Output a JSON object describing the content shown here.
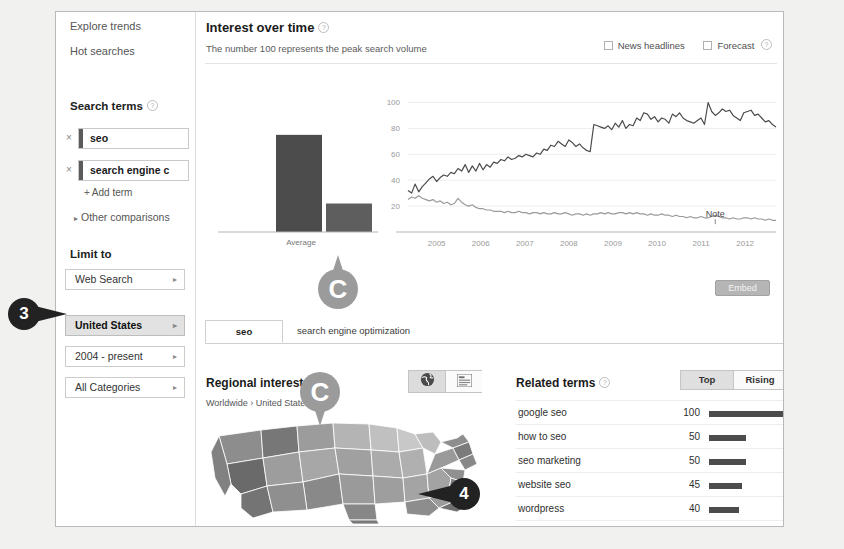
{
  "sidebar": {
    "nav": [
      {
        "label": "Explore trends"
      },
      {
        "label": "Hot searches"
      }
    ],
    "search_terms_title": "Search terms",
    "terms": [
      {
        "value": "seo",
        "color": "#5b5b5b",
        "remove_label": "×"
      },
      {
        "value": "search engine c",
        "color": "#5b5b5b",
        "remove_label": "×"
      }
    ],
    "add_term_label": "Add term",
    "add_term_plus": "+",
    "other_comparisons_label": "Other comparisons",
    "limit_to_title": "Limit to",
    "limits": [
      {
        "label": "Web Search",
        "selected": false
      },
      {
        "label": "United States",
        "selected": true
      },
      {
        "label": "2004 - present",
        "selected": false
      },
      {
        "label": "All Categories",
        "selected": false
      }
    ]
  },
  "interest_over_time": {
    "title": "Interest over time",
    "subtitle": "The number 100 represents the peak search volume",
    "options": [
      {
        "label": "News headlines",
        "checked": false
      },
      {
        "label": "Forecast",
        "checked": false
      }
    ],
    "embed_label": "Embed",
    "note_label": "Note",
    "average_label": "Average"
  },
  "chart_data": {
    "type": "line",
    "title": "Interest over time",
    "xlabel": "",
    "ylabel": "",
    "ylim": [
      0,
      105
    ],
    "yticks": [
      20,
      40,
      60,
      80,
      100
    ],
    "xticks": [
      "2005",
      "2006",
      "2007",
      "2008",
      "2009",
      "2010",
      "2011",
      "2012"
    ],
    "grid": true,
    "legend": "none",
    "average_bars": {
      "type": "bar",
      "categories": [
        "seo",
        "search engine optimization"
      ],
      "values": [
        75,
        22
      ],
      "xlabel": "Average"
    },
    "series": [
      {
        "name": "seo",
        "color": "#4c4c4c",
        "values": [
          32,
          30,
          37,
          31,
          35,
          38,
          41,
          43,
          39,
          42,
          44,
          43,
          46,
          45,
          49,
          47,
          52,
          46,
          51,
          47,
          53,
          48,
          52,
          50,
          54,
          53,
          56,
          55,
          58,
          56,
          57,
          59,
          58,
          60,
          59,
          58,
          61,
          60,
          64,
          63,
          67,
          66,
          70,
          68,
          66,
          71,
          69,
          66,
          68,
          65,
          63,
          62,
          83,
          82,
          81,
          80,
          82,
          79,
          84,
          81,
          86,
          80,
          83,
          82,
          88,
          86,
          92,
          91,
          87,
          89,
          85,
          88,
          87,
          84,
          91,
          89,
          92,
          88,
          86,
          85,
          84,
          86,
          88,
          83,
          100,
          93,
          90,
          92,
          95,
          93,
          94,
          90,
          88,
          86,
          92,
          93,
          94,
          90,
          91,
          88,
          85,
          86,
          83,
          81
        ]
      },
      {
        "name": "search engine optimization",
        "color": "#9a9a9a",
        "values": [
          25,
          27,
          26,
          28,
          26,
          25,
          24,
          25,
          23,
          24,
          22,
          23,
          21,
          22,
          26,
          23,
          21,
          20,
          21,
          19,
          18,
          18,
          17,
          17,
          16,
          16,
          16,
          15,
          16,
          15,
          15,
          16,
          15,
          15,
          14,
          15,
          15,
          14,
          15,
          14,
          14,
          15,
          14,
          14,
          15,
          14,
          13,
          14,
          14,
          13,
          14,
          13,
          14,
          14,
          15,
          14,
          15,
          14,
          14,
          15,
          15,
          14,
          15,
          14,
          15,
          14,
          14,
          13,
          14,
          13,
          13,
          14,
          13,
          13,
          12,
          13,
          12,
          12,
          11,
          12,
          11,
          11,
          12,
          11,
          11,
          12,
          13,
          12,
          11,
          11,
          10,
          11,
          10,
          10,
          11,
          11,
          10,
          11,
          10,
          10,
          9,
          10,
          9,
          9
        ]
      }
    ]
  },
  "tabs": [
    {
      "label": "seo",
      "active": true
    },
    {
      "label": "search engine optimization",
      "active": false
    }
  ],
  "regional": {
    "title": "Regional interest",
    "breadcrumb": "Worldwide › United States",
    "views": [
      {
        "name": "globe-view",
        "selected": true
      },
      {
        "name": "list-view",
        "selected": false
      }
    ]
  },
  "related": {
    "title": "Related terms",
    "toggle": [
      {
        "label": "Top",
        "selected": true
      },
      {
        "label": "Rising",
        "selected": false
      }
    ],
    "rows": [
      {
        "term": "google seo",
        "value": "100",
        "pct": 100
      },
      {
        "term": "how to seo",
        "value": "50",
        "pct": 50
      },
      {
        "term": "seo marketing",
        "value": "50",
        "pct": 50
      },
      {
        "term": "website seo",
        "value": "45",
        "pct": 45
      },
      {
        "term": "wordpress",
        "value": "40",
        "pct": 40
      },
      {
        "term": "wordpress seo",
        "value": "40",
        "pct": 40
      }
    ]
  },
  "callouts": [
    {
      "label": "3",
      "points_to": "united-states-limit-button"
    },
    {
      "label": "4",
      "points_to": "regional-interest-map"
    },
    {
      "label": "C",
      "points_to": "average-bars"
    },
    {
      "label": "C",
      "points_to": "regional-interest-title"
    }
  ],
  "colors": {
    "series_primary": "#4c4c4c",
    "series_secondary": "#9a9a9a",
    "selected_bg": "#e2e2e2",
    "callout": "#222222",
    "pin": "#9b9b9b"
  }
}
